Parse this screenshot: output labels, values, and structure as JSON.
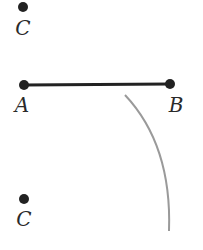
{
  "diagram": {
    "points": [
      {
        "id": "C_top",
        "label": "C",
        "x": 23,
        "y": 7,
        "label_x": 23,
        "label_y": 35
      },
      {
        "id": "A",
        "label": "A",
        "x": 24,
        "y": 85,
        "label_x": 22,
        "label_y": 112
      },
      {
        "id": "B",
        "label": "B",
        "x": 170,
        "y": 84,
        "label_x": 176,
        "label_y": 112
      },
      {
        "id": "C_bottom",
        "label": "C",
        "x": 24,
        "y": 199,
        "label_x": 24,
        "label_y": 226
      }
    ],
    "segment": {
      "from": "A",
      "to": "B",
      "color": "#222222"
    },
    "arc": {
      "color": "#9a9a9a",
      "path": "M125 95 Q 172 145 169 231"
    },
    "colors": {
      "point": "#222222",
      "label": "#2a2a2a",
      "arc": "#9a9a9a"
    }
  }
}
